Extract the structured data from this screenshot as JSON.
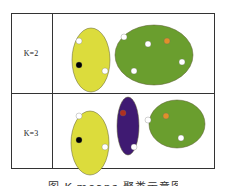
{
  "figure": {
    "rows": [
      {
        "label": "K=2",
        "clusters": [
          {
            "name": "cluster-yellow",
            "color": "#dcdc3c",
            "cx": 91,
            "cy": 60,
            "rx": 19,
            "ry": 32,
            "points": [
              {
                "x": 79,
                "y": 41,
                "color": "#ffffff"
              },
              {
                "x": 79,
                "y": 65,
                "color": "#000000"
              },
              {
                "x": 105,
                "y": 71,
                "color": "#ffffff"
              }
            ]
          },
          {
            "name": "cluster-green",
            "color": "#6a9e2e",
            "cx": 154,
            "cy": 55,
            "rx": 39,
            "ry": 30,
            "points": [
              {
                "x": 124,
                "y": 37,
                "color": "#ffffff"
              },
              {
                "x": 148,
                "y": 44,
                "color": "#ffffff"
              },
              {
                "x": 167,
                "y": 41,
                "color": "#e0902a"
              },
              {
                "x": 182,
                "y": 62,
                "color": "#ffffff"
              },
              {
                "x": 134,
                "y": 71,
                "color": "#ffffff"
              }
            ]
          }
        ]
      },
      {
        "label": "K=3",
        "clusters": [
          {
            "name": "cluster-yellow",
            "color": "#dcdc3c",
            "cx": 90,
            "cy": 143,
            "rx": 19,
            "ry": 32,
            "points": [
              {
                "x": 79,
                "y": 116,
                "color": "#ffffff"
              },
              {
                "x": 79,
                "y": 140,
                "color": "#000000"
              },
              {
                "x": 105,
                "y": 147,
                "color": "#ffffff"
              }
            ]
          },
          {
            "name": "cluster-purple",
            "color": "#3f1a72",
            "cx": 128,
            "cy": 126,
            "rx": 11,
            "ry": 29,
            "points": [
              {
                "x": 123,
                "y": 113,
                "color": "#b03020"
              },
              {
                "x": 134,
                "y": 147,
                "color": "#ffffff"
              }
            ]
          },
          {
            "name": "cluster-green",
            "color": "#6a9e2e",
            "cx": 177,
            "cy": 124,
            "rx": 28,
            "ry": 24,
            "points": [
              {
                "x": 166,
                "y": 116,
                "color": "#e0902a"
              },
              {
                "x": 148,
                "y": 120,
                "color": "#ffffff"
              },
              {
                "x": 181,
                "y": 138,
                "color": "#ffffff"
              }
            ]
          }
        ]
      }
    ],
    "caption": "图 K-means 聚类示意图"
  }
}
